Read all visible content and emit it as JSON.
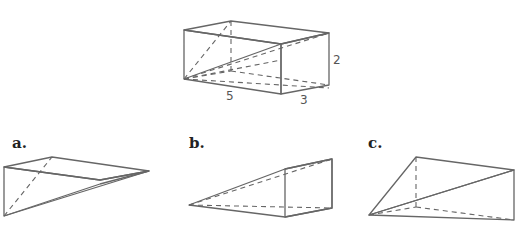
{
  "main_figure": {
    "name": "rectangular-prism",
    "dimensions": {
      "height": "2",
      "length": "5",
      "width": "3"
    }
  },
  "options": [
    {
      "label": "a."
    },
    {
      "label": "b."
    },
    {
      "label": "c."
    }
  ],
  "colors": {
    "face_light": "#e4e4e4",
    "face_mid": "#d6d6d6",
    "face_dark": "#bdbdbd",
    "edge": "#666666"
  }
}
